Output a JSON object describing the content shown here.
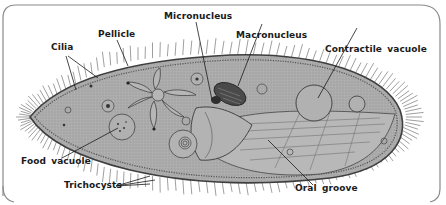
{
  "diagram": {
    "colors": {
      "background": "#ffffff",
      "frame": "#8a8a8a",
      "cell_fill": "#a9a9a9",
      "cell_edge": "#4a4a4a",
      "cilia": "#5a5a5a",
      "leader": "#1a1a1a",
      "label_text": "#1a1a1a",
      "nucleus": "#3a3a3a"
    },
    "labels": {
      "cilia": "Cilia",
      "pellicle": "Pellicle",
      "micronucleus": "Micronucleus",
      "macronucleus": "Macronucleus",
      "contractile_vacuole": "Contractile vacuole",
      "food_vacuole": "Food vacuole",
      "trichocysts": "Trichocysts",
      "oral_groove": "Oral groove"
    }
  }
}
